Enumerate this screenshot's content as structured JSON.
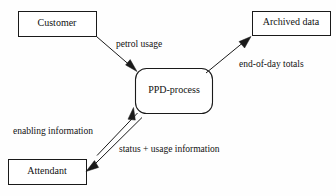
{
  "diagram": {
    "type": "data-flow-diagram",
    "background_color": "#fefefe",
    "line_color": "#1a1a1a",
    "text_color": "#111111",
    "nodes": [
      {
        "id": "customer",
        "label": "Customer",
        "shape": "rectangle",
        "role": "external-entity",
        "x": 18,
        "y": 11,
        "width": 78,
        "height": 25
      },
      {
        "id": "archived-data",
        "label": "Archived data",
        "shape": "rectangle",
        "role": "external-entity",
        "x": 252,
        "y": 11,
        "width": 78,
        "height": 24
      },
      {
        "id": "ppd-process",
        "label": "PPD-process",
        "shape": "rounded-rectangle",
        "role": "process",
        "x": 135,
        "y": 68,
        "width": 78,
        "height": 46
      },
      {
        "id": "attendant",
        "label": "Attendant",
        "shape": "rectangle",
        "role": "external-entity",
        "x": 8,
        "y": 159,
        "width": 78,
        "height": 25
      }
    ],
    "flows": [
      {
        "id": "petrol-usage",
        "label": "petrol usage",
        "from": "customer",
        "to": "ppd-process",
        "direction": "one-way"
      },
      {
        "id": "end-of-day-totals",
        "label": "end-of-day totals",
        "from": "ppd-process",
        "to": "archived-data",
        "direction": "one-way"
      },
      {
        "id": "enabling-information",
        "label": "enabling information",
        "from": "attendant",
        "to": "ppd-process",
        "direction": "one-way"
      },
      {
        "id": "status-usage-information",
        "label": "status + usage information",
        "from": "ppd-process",
        "to": "attendant",
        "direction": "one-way"
      }
    ]
  }
}
